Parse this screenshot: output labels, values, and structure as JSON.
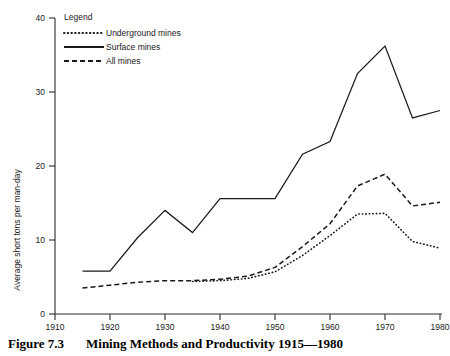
{
  "caption": {
    "number": "Figure 7.3",
    "text": "Mining Methods and Productivity 1915—1980"
  },
  "legend": {
    "title": "Legend",
    "items": [
      {
        "label": "Underground mines",
        "style": "dotted"
      },
      {
        "label": "Surface mines",
        "style": "solid"
      },
      {
        "label": "All mines",
        "style": "dashed"
      }
    ]
  },
  "chart_data": {
    "type": "line",
    "title": "Mining Methods and Productivity 1915—1980",
    "xlabel": "",
    "ylabel": "Average short tons per man-day",
    "xlim": [
      1910,
      1980
    ],
    "ylim": [
      0,
      40
    ],
    "xticks": [
      1910,
      1920,
      1930,
      1940,
      1950,
      1960,
      1970,
      1980
    ],
    "yticks": [
      0,
      10,
      20,
      30,
      40
    ],
    "xtick_labels": [
      "1910",
      "1920",
      "1930",
      "1940",
      "1950",
      "1960",
      "1970",
      "1980"
    ],
    "ytick_labels": [
      "0",
      "10",
      "20",
      "30",
      "40"
    ],
    "grid": false,
    "legend_position": "top-left",
    "series": [
      {
        "name": "Surface mines",
        "style": "solid",
        "x": [
          1915,
          1920,
          1925,
          1930,
          1935,
          1940,
          1945,
          1950,
          1955,
          1960,
          1965,
          1970,
          1975,
          1980
        ],
        "values": [
          5.8,
          5.8,
          10.3,
          14.0,
          11.0,
          15.6,
          15.6,
          15.6,
          21.6,
          23.3,
          32.5,
          36.2,
          26.5,
          27.5
        ]
      },
      {
        "name": "All mines",
        "style": "dashed",
        "x": [
          1915,
          1920,
          1925,
          1930,
          1935,
          1940,
          1945,
          1950,
          1955,
          1960,
          1965,
          1970,
          1975,
          1980
        ],
        "values": [
          3.5,
          3.9,
          4.3,
          4.5,
          4.5,
          4.7,
          5.1,
          6.3,
          9.1,
          12.2,
          17.3,
          18.9,
          14.6,
          15.1
        ]
      },
      {
        "name": "Underground mines",
        "style": "dotted",
        "x": [
          1935,
          1940,
          1945,
          1950,
          1955,
          1960,
          1965,
          1970,
          1975,
          1980
        ],
        "values": [
          4.4,
          4.5,
          4.8,
          5.7,
          7.9,
          10.6,
          13.5,
          13.6,
          9.8,
          8.9
        ]
      }
    ]
  }
}
